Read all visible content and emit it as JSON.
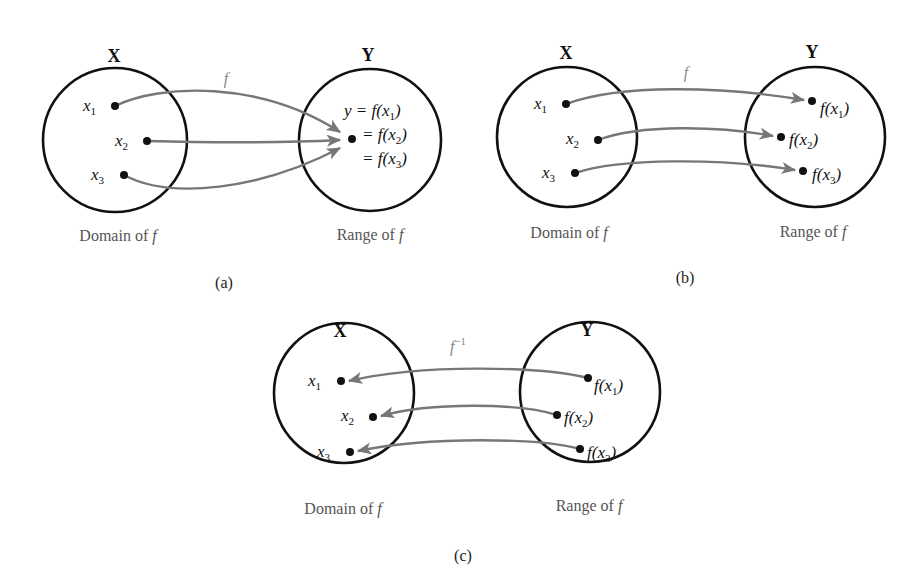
{
  "figure": {
    "panels": [
      {
        "id": "a",
        "label": "(a)",
        "domain_set": "X",
        "range_set": "Y",
        "map_label": "f",
        "domain_caption": "Domain of f",
        "range_caption": "Range of f",
        "domain_points": [
          "x1",
          "x2",
          "x3"
        ],
        "range_points": [
          "y = f(x1)",
          "= f(x2)",
          "= f(x3)"
        ],
        "description": "Many-to-one: x1, x2, x3 all map to the same y"
      },
      {
        "id": "b",
        "label": "(b)",
        "domain_set": "X",
        "range_set": "Y",
        "map_label": "f",
        "domain_caption": "Domain of f",
        "range_caption": "Range of f",
        "domain_points": [
          "x1",
          "x2",
          "x3"
        ],
        "range_points": [
          "f(x1)",
          "f(x2)",
          "f(x3)"
        ],
        "description": "One-to-one: each xi maps to a distinct f(xi)"
      },
      {
        "id": "c",
        "label": "(c)",
        "domain_set": "X",
        "range_set": "Y",
        "map_label": "f⁻¹",
        "domain_caption": "Domain of f",
        "range_caption": "Range of f",
        "domain_points": [
          "x1",
          "x2",
          "x3"
        ],
        "range_points": [
          "f(x1)",
          "f(x2)",
          "f(x3)"
        ],
        "description": "Inverse mapping: each f(xi) maps back to xi"
      }
    ],
    "colors": {
      "circle": "#111111",
      "arrow": "#777777",
      "caption": "#555555",
      "map_label": "#888888"
    }
  },
  "text": {
    "X": "X",
    "Y": "Y",
    "f": "f",
    "finv_base": "f",
    "finv_sup": "−1",
    "x": "x",
    "s1": "1",
    "s2": "2",
    "s3": "3",
    "domain_caption": "Domain of f",
    "domain_prefix": "Domain of ",
    "range_prefix": "Range of ",
    "y_eq": "y = ",
    "eq": "= ",
    "f_open": "f(",
    "close": ")",
    "panel_a": "(a)",
    "panel_b": "(b)",
    "panel_c": "(c)"
  }
}
